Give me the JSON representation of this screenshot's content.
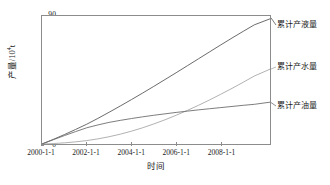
{
  "chart_data": {
    "type": "line",
    "title": "",
    "xlabel": "时间",
    "ylabel": "产量/10⁴t",
    "ylabel_base": "产量/10",
    "ylabel_exp": "4",
    "ylabel_unit": "t",
    "grid": false,
    "legend_position": "right-inline",
    "xlim": [
      2000,
      2010.2
    ],
    "ylim": [
      0,
      90
    ],
    "y_ticks": [
      0,
      10,
      20,
      30,
      40,
      50,
      60,
      70,
      80,
      90
    ],
    "x_ticks": [
      {
        "value": 2000,
        "label": "2000-1-1"
      },
      {
        "value": 2002,
        "label": "2002-1-1"
      },
      {
        "value": 2004,
        "label": "2004-1-1"
      },
      {
        "value": 2006,
        "label": "2006-1-1"
      },
      {
        "value": 2008,
        "label": "2008-1-1"
      }
    ],
    "x": [
      2000,
      2000.5,
      2001,
      2001.5,
      2002,
      2002.5,
      2003,
      2003.5,
      2004,
      2004.5,
      2005,
      2005.5,
      2006,
      2006.5,
      2007,
      2007.5,
      2008,
      2008.5,
      2009,
      2009.5,
      2010.2
    ],
    "series": [
      {
        "name": "累计产液量",
        "color": "#5a5a5a",
        "label_y_px": 20,
        "values": [
          0,
          3.2,
          6.6,
          10.2,
          13.9,
          18.0,
          22.3,
          26.7,
          31.2,
          35.8,
          40.5,
          45.3,
          50.1,
          55.0,
          59.9,
          64.8,
          69.7,
          74.5,
          79.2,
          83.8,
          88.0
        ]
      },
      {
        "name": "累计产水量",
        "color": "#a8a8a8",
        "label_y_px": 62,
        "values": [
          0,
          0.3,
          0.8,
          1.5,
          2.4,
          3.6,
          5.1,
          6.9,
          9.0,
          11.4,
          14.1,
          17.0,
          20.2,
          23.6,
          27.2,
          31.0,
          35.0,
          39.1,
          43.4,
          47.8,
          52.6
        ]
      },
      {
        "name": "累计产油量",
        "color": "#6e6e6e",
        "label_y_px": 101,
        "values": [
          0,
          3.0,
          5.9,
          8.7,
          11.4,
          13.4,
          15.2,
          16.6,
          17.9,
          19.1,
          20.2,
          21.2,
          22.2,
          23.1,
          24.0,
          24.8,
          25.6,
          26.4,
          27.2,
          27.9,
          29.4
        ]
      }
    ]
  }
}
